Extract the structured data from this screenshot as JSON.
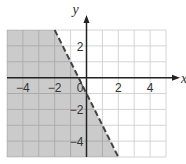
{
  "chart_data": {
    "type": "area",
    "title": "",
    "xlabel": "x",
    "ylabel": "y",
    "xlim": [
      -5,
      5
    ],
    "ylim": [
      -5,
      3
    ],
    "grid": true,
    "grid_step": 1,
    "x_ticks": [
      -4,
      -2,
      2,
      4
    ],
    "x_tick_labels": [
      "−4",
      "−2",
      "2",
      "4"
    ],
    "y_ticks": [
      2,
      -2,
      -4
    ],
    "y_tick_labels": [
      "2",
      "−2",
      "−4"
    ],
    "origin_label": "0",
    "boundary": {
      "equation": "y = -2x - 1",
      "style": "dashed",
      "slope": -2,
      "intercept": -1,
      "points": [
        [
          -2,
          3
        ],
        [
          2,
          -5
        ]
      ]
    },
    "shaded_region": {
      "inequality": "y < -2x - 1",
      "side": "left/below",
      "polygon": [
        [
          -5,
          3
        ],
        [
          -2,
          3
        ],
        [
          2,
          -5
        ],
        [
          -5,
          -5
        ]
      ]
    },
    "legend": null
  },
  "colors": {
    "shade": "#cbcbcb",
    "grid": "#d4d4d4",
    "grid_shaded": "#aaaaaa",
    "axis": "#222222",
    "boundary": "#444444"
  }
}
